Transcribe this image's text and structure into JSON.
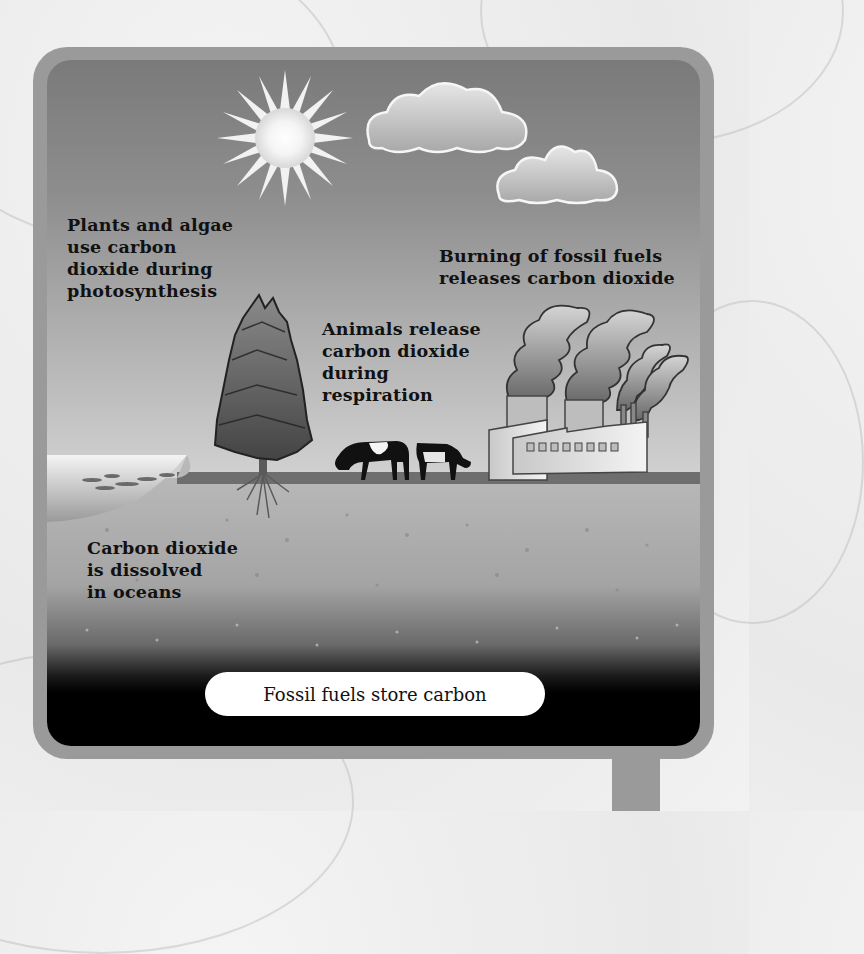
{
  "diagram": {
    "labels": {
      "photosynthesis": "Plants and algae\nuse carbon\ndioxide during\nphotosynthesis",
      "fossil_fuels": "Burning of fossil fuels\nreleases carbon dioxide",
      "respiration": "Animals release\ncarbon dioxide\nduring\nrespiration",
      "oceans": "Carbon dioxide\nis dissolved\nin oceans",
      "storage": "Fossil fuels store carbon"
    },
    "elements": [
      "sun",
      "clouds",
      "tree",
      "cows",
      "factory",
      "ocean",
      "soil",
      "fossil-fuel-layer"
    ],
    "colors": {
      "frame": "#9a9a9a",
      "sky_top": "#7a7a7a",
      "sky_bottom": "#dcdcdc",
      "ground_dark": "#000000",
      "pill": "#ffffff"
    }
  }
}
